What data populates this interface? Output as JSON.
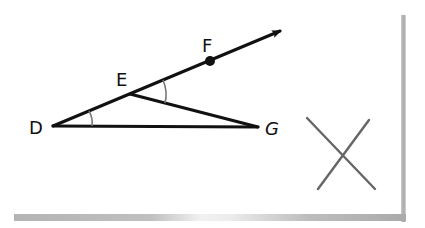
{
  "figure": {
    "type": "geometry-diagram",
    "points": {
      "D": {
        "label": "D"
      },
      "E": {
        "label": "E"
      },
      "F": {
        "label": "F"
      },
      "G": {
        "label": "G"
      }
    },
    "segments": [
      "DE",
      "EF",
      "EG",
      "DG"
    ],
    "ray": "DF",
    "marked_angles": [
      "EDG",
      "FEG"
    ],
    "answer_mark": "X",
    "colors": {
      "lines": "#111111",
      "angle_arcs": "#777777",
      "x_mark": "#666666",
      "paper_shadow": "#a8a8a8"
    }
  }
}
